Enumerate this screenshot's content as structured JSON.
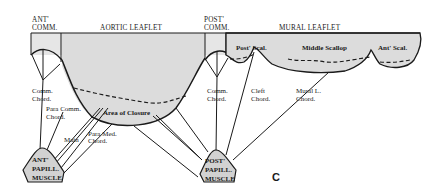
{
  "figure": {
    "panel_label": "C"
  },
  "headers": {
    "ant_comm": [
      "ANT'",
      "COMM."
    ],
    "aortic_leaflet": "AORTIC LEAFLET",
    "post_comm": [
      "POST'",
      "COMM."
    ],
    "mural_leaflet": "MURAL LEAFLET"
  },
  "scallops": {
    "posterior": "Post' Scal.",
    "middle": "Middle Scallop",
    "anterior": "Ant' Scal."
  },
  "labels": {
    "area_of_closure": "Area of Closure",
    "comm_chord_left": [
      "Comm.",
      "Chord."
    ],
    "para_comm_chord": [
      "Para Comm.",
      "Chord."
    ],
    "main": "Main",
    "para_med_chord": [
      "Para Med.",
      "Chord."
    ],
    "comm_chord_right": [
      "Comm.",
      "Chord."
    ],
    "cleft_chord": [
      "Cleft",
      "Chord."
    ],
    "mural_l_chord": [
      "Mural L.",
      "Chord."
    ]
  },
  "muscles": {
    "anterior": [
      "ANT'",
      "PAPILL.",
      "MUSCLE"
    ],
    "posterior": [
      "POST'",
      "PAPILL.",
      "MUSCLE"
    ]
  }
}
